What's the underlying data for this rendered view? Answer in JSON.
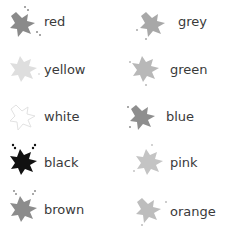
{
  "left_column": [
    {
      "label": "red",
      "splat_color": "#8a8a8a",
      "icon": "splat-icon"
    },
    {
      "label": "yellow",
      "splat_color": "#dedede",
      "icon": "splat-icon"
    },
    {
      "label": "white",
      "splat_color": "#f4f4f4",
      "icon": "splat-icon"
    },
    {
      "label": "black",
      "splat_color": "#111111",
      "icon": "splat-icon"
    },
    {
      "label": "brown",
      "splat_color": "#8c8c8c",
      "icon": "splat-icon"
    }
  ],
  "right_column": [
    {
      "label": "grey",
      "splat_color": "#a8a8a8",
      "icon": "splat-icon"
    },
    {
      "label": "green",
      "splat_color": "#b8b8b8",
      "icon": "splat-icon"
    },
    {
      "label": "blue",
      "splat_color": "#8e8e8e",
      "icon": "splat-icon"
    },
    {
      "label": "pink",
      "splat_color": "#c4c4c4",
      "icon": "splat-icon"
    },
    {
      "label": "orange",
      "splat_color": "#bdbdbd",
      "icon": "splat-icon"
    }
  ]
}
